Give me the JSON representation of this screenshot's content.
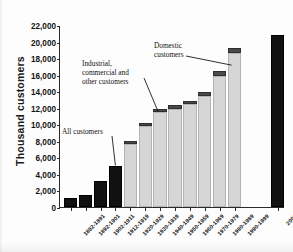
{
  "chart_data": {
    "type": "bar",
    "title": "",
    "subtitle": "",
    "xlabel": "",
    "ylabel": "Thousand customers",
    "ylim": [
      0,
      22000
    ],
    "ytick_step": 2000,
    "ytick_labels": [
      "22,000",
      "20,000",
      "18,000",
      "16,000",
      "14,000",
      "12,000",
      "10,000",
      "8,000",
      "6,000",
      "4,000",
      "2,000",
      "0"
    ],
    "grid": false,
    "legend_position": "annotations",
    "stacked": true,
    "categories": [
      "1882-1891",
      "1892-1901",
      "1902-1911",
      "1912-1919",
      "1920-1929",
      "1930-1939",
      "1940-1949",
      "1950-1959",
      "1960-1969",
      "1970-1979",
      "1980-1989",
      "1990-1999",
      "2000"
    ],
    "series": [
      {
        "name": "All customers",
        "color": "#111111",
        "values": [
          1100,
          1500,
          3100,
          4900,
          null,
          null,
          null,
          null,
          null,
          null,
          null,
          null,
          20800
        ]
      },
      {
        "name": "Domestic customers",
        "color": "#d6d6d6",
        "values": [
          null,
          null,
          null,
          null,
          7600,
          9800,
          11500,
          11900,
          12400,
          13400,
          15800,
          18600,
          null
        ]
      },
      {
        "name": "Industrial, commercial and other customers",
        "color": "#4a4a4a",
        "values": [
          null,
          null,
          null,
          null,
          400,
          400,
          400,
          450,
          450,
          500,
          600,
          600,
          null
        ]
      }
    ],
    "totals": [
      1100,
      1500,
      3100,
      4900,
      8000,
      10200,
      11900,
      12350,
      12850,
      13900,
      16400,
      19200,
      20800
    ],
    "annotations": [
      {
        "text": "All customers",
        "target_category": "1912-1919"
      },
      {
        "text": "Industrial,\ncommercial and\nother customers",
        "target_category": "1940-1949"
      },
      {
        "text": "Domestic customers",
        "target_category": "1990-1999"
      }
    ]
  },
  "axis": {
    "y_title": "Thousand customers"
  },
  "labels": {
    "all_customers": "All customers",
    "industrial": "Industrial,\ncommercial and\nother customers",
    "domestic": "Domestic\ncustomers"
  }
}
